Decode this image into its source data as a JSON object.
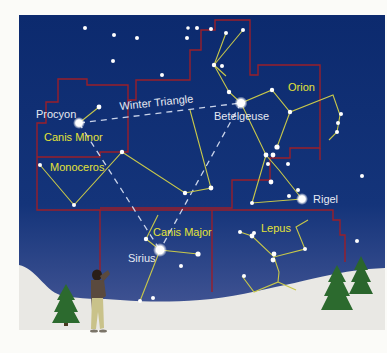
{
  "colors": {
    "sky_top": "#0c2a6e",
    "sky_bottom": "#3c4a8c",
    "snow": "#e9e8e4",
    "boundary": "#9a1f2a",
    "stick_line": "#c8c84a",
    "triangle_dash": "#c9d3ea",
    "star": "#ffffff",
    "constellation_label": "#e4e338",
    "star_label": "#e6e9f2",
    "tree": "#2c6a2e"
  },
  "labels": {
    "stars": {
      "procyon": "Procyon",
      "betelgeuse": "Betelgeuse",
      "rigel": "Rigel",
      "sirius": "Sirius"
    },
    "asterism": "Winter Triangle",
    "constellations": {
      "orion": "Orion",
      "canis_minor": "Canis Minor",
      "monoceros": "Monoceros",
      "canis_major": "Canis Major",
      "lepus": "Lepus"
    }
  }
}
